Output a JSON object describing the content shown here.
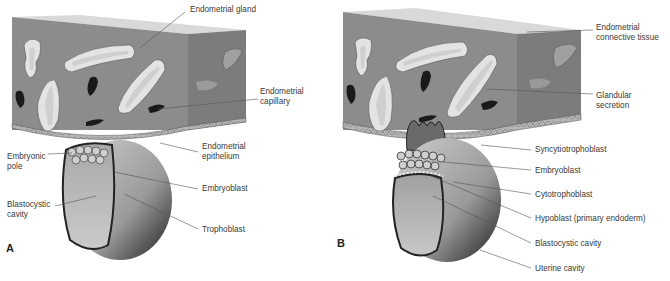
{
  "figure": {
    "panels": [
      {
        "letter": "A",
        "labels": {
          "endometrial_gland": "Endometrial gland",
          "endometrial_capillary": "Endometrial\ncapillary",
          "endometrial_epithelium": "Endometrial\nepithelium",
          "embryonic_pole": "Embryonic\npole",
          "embryoblast": "Embryoblast",
          "blastocystic_cavity": "Blastocystic\ncavity",
          "trophoblast": "Trophoblast"
        }
      },
      {
        "letter": "B",
        "labels": {
          "endometrial_connective_tissue": "Endometrial\nconnective tissue",
          "glandular_secretion": "Glandular\nsecretion",
          "syncytiotrophoblast": "Syncytiotrophoblast",
          "embryoblast": "Embryoblast",
          "cytotrophoblast": "Cytotrophoblast",
          "hypoblast": "Hypoblast (primary endoderm)",
          "blastocystic_cavity": "Blastocystic cavity",
          "uterine_cavity": "Uterine cavity"
        }
      }
    ],
    "colors": {
      "tissue_front": "#8a8a8a",
      "tissue_side": "#7a7a7a",
      "tissue_top": "#d8d8d8",
      "gland_lumen": "#d6d6d6",
      "capillary": "#1a1a1a",
      "blastocyst_light": "#bdbdbd",
      "blastocyst_dark": "#2a2a2a",
      "leader_line": "#555555"
    }
  }
}
